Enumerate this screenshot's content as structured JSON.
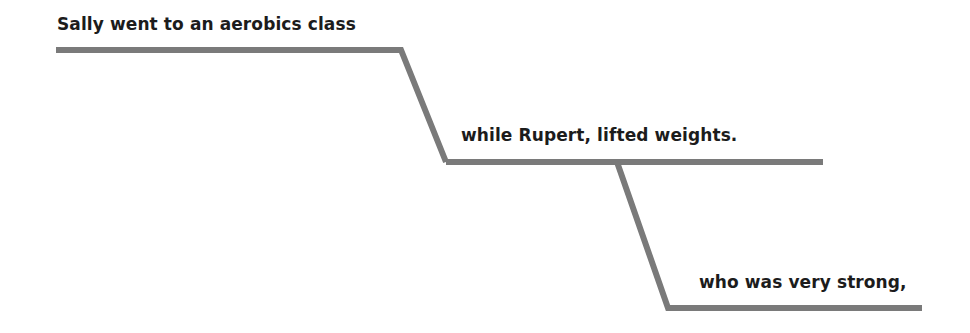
{
  "diagram": {
    "type": "sentence-diagram",
    "line_color": "#7a7a7a",
    "text_color": "#1c1c1c",
    "clauses": [
      {
        "id": "main",
        "text": "Sally went to an aerobics class"
      },
      {
        "id": "subordinate",
        "text": "while Rupert, lifted weights."
      },
      {
        "id": "relative",
        "text": "who was very strong,"
      }
    ]
  }
}
